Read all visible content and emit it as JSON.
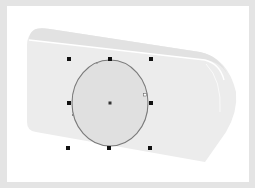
{
  "canvas": {
    "background": "#ffffff",
    "frame_color": "#e4e4e4"
  },
  "object": {
    "name": "camera-body",
    "fill": "#ececec",
    "top_fill": "#e4e4e4",
    "highlight": "#ffffff"
  },
  "selection": {
    "shape": "ellipse",
    "center": [
      110,
      103
    ],
    "rx": 38,
    "ry": 43,
    "fill": "#e0e0e0",
    "stroke": "#7a7a7a",
    "handle_color": "#111111",
    "handles": [
      {
        "id": "top-left",
        "x": 69,
        "y": 59
      },
      {
        "id": "top-center",
        "x": 110,
        "y": 59
      },
      {
        "id": "top-right",
        "x": 151,
        "y": 59
      },
      {
        "id": "middle-left",
        "x": 69,
        "y": 103
      },
      {
        "id": "middle-right",
        "x": 151,
        "y": 103
      },
      {
        "id": "bottom-left",
        "x": 68,
        "y": 148
      },
      {
        "id": "bottom-center",
        "x": 109,
        "y": 148
      },
      {
        "id": "bottom-right",
        "x": 150,
        "y": 148
      }
    ]
  }
}
